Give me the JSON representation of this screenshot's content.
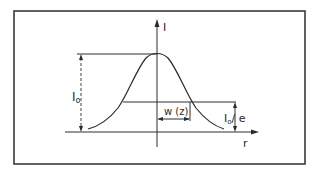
{
  "diagram": {
    "axes": {
      "y_label": "I",
      "x_label": "r"
    },
    "annotations": {
      "peak_intensity": "I",
      "peak_intensity_sub": "o",
      "width_label": "w (z)",
      "one_over_e_main": "I",
      "one_over_e_sub": "o",
      "one_over_e_suffix": "/ e"
    },
    "colors": {
      "ink": "#2a2a2a",
      "background": "#ffffff"
    }
  }
}
